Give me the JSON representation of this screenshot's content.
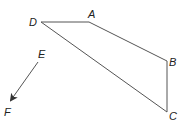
{
  "diagram": {
    "type": "geometry",
    "points": {
      "A": {
        "label": "A",
        "x": 89,
        "y": 22
      },
      "B": {
        "label": "B",
        "x": 167,
        "y": 61
      },
      "C": {
        "label": "C",
        "x": 167,
        "y": 112
      },
      "D": {
        "label": "D",
        "x": 41,
        "y": 22
      },
      "E": {
        "label": "E",
        "x": 38,
        "y": 62
      },
      "F": {
        "label": "F",
        "x": 10,
        "y": 101
      }
    },
    "polygon": [
      "D",
      "A",
      "B",
      "C"
    ],
    "ray": {
      "from": "E",
      "to": "F",
      "arrow": true
    },
    "line_color": "#555555"
  }
}
